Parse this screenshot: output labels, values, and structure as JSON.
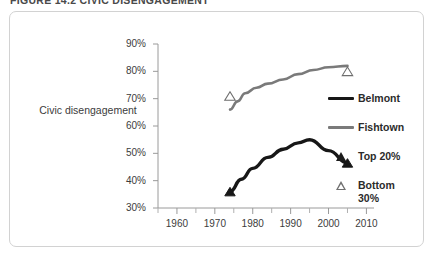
{
  "figure": {
    "caption": "FIGURE 14.2   CIVIC DISENGAGEMENT"
  },
  "chart_data": {
    "type": "line",
    "title": "",
    "xlabel": "",
    "ylabel": "Civic disengagement",
    "xlim": [
      1955,
      2012
    ],
    "ylim": [
      30,
      90
    ],
    "y_tick_labels": [
      "90%",
      "80%",
      "70%",
      "60%",
      "50%",
      "40%",
      "30%"
    ],
    "y_tick_values": [
      90,
      80,
      70,
      60,
      50,
      40,
      30
    ],
    "x_tick_labels": [
      "1960",
      "1970",
      "1980",
      "1990",
      "2000",
      "2010"
    ],
    "x_tick_values": [
      1960,
      1970,
      1980,
      1990,
      2000,
      2010
    ],
    "x_minor_tick_values": [
      1955,
      1965,
      1975,
      1985,
      1995,
      2005
    ],
    "grid": false,
    "legend_position": "right",
    "series": [
      {
        "name": "Belmont",
        "color": "#171717",
        "marker": "Top 20%",
        "x": [
          1974,
          1977,
          1980,
          1984,
          1988,
          1992,
          1995,
          2000,
          2005
        ],
        "values": [
          36.0,
          40.5,
          44.5,
          48.5,
          51.5,
          53.8,
          55.0,
          51.0,
          46.5
        ]
      },
      {
        "name": "Fishtown",
        "color": "#7a7a7a",
        "marker": "Bottom 30%",
        "x": [
          1974,
          1976,
          1978,
          1981,
          1984,
          1988,
          1992,
          1996,
          2000,
          2005
        ],
        "values": [
          66.0,
          69.0,
          72.0,
          74.0,
          75.5,
          77.0,
          79.0,
          80.5,
          81.5,
          82.0
        ]
      }
    ],
    "endpoint_markers": [
      {
        "series": "Belmont",
        "marker": "Top 20%",
        "x": 1974,
        "y": 36.0
      },
      {
        "series": "Belmont",
        "marker": "Top 20%",
        "x": 2005,
        "y": 46.5
      },
      {
        "series": "Fishtown",
        "marker": "Bottom 30%",
        "x": 1974,
        "y": 71.0
      },
      {
        "series": "Fishtown",
        "marker": "Bottom 30%",
        "x": 2005,
        "y": 80.0
      }
    ]
  },
  "legend": {
    "entries": [
      {
        "label": "Belmont",
        "mark": "line-black",
        "color": "#171717"
      },
      {
        "label": "Fishtown",
        "mark": "line-gray",
        "color": "#7a7a7a"
      },
      {
        "label": "Top 20%",
        "mark": "triangle-solid",
        "color": "#1b1b1b"
      },
      {
        "label": "Bottom 30%",
        "mark": "triangle-open",
        "color": "#707070"
      }
    ]
  },
  "colors": {
    "frame_border": "#d2d2d2",
    "axis": "#9a9a9a",
    "text": "#3c3c3c",
    "background": "#ffffff"
  }
}
